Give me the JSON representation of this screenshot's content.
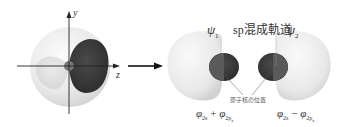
{
  "figure": {
    "left_panel": {
      "axis_y_label": "y",
      "axis_z_label": "z",
      "description": "2s orbital (sphere) overlapped with 2pz orbital lobe"
    },
    "arrow": "right-arrow",
    "right_panel": {
      "title": "sp混成軌道",
      "psi1_symbol": "ψ",
      "psi1_index": "1",
      "psi2_symbol": "ψ",
      "psi2_index": "2",
      "nucleus_label": "原子核の位置",
      "formula1": {
        "phi_a": "φ",
        "sub_a": "2s",
        "op": " + ",
        "phi_b": "φ",
        "sub_b": "2p",
        "sub_b_index": "z"
      },
      "formula2": {
        "phi_a": "φ",
        "sub_a": "2s",
        "op": " − ",
        "phi_b": "φ",
        "sub_b": "2p",
        "sub_b_index": "z"
      }
    },
    "colors": {
      "light_lobe": "#ececec",
      "dark_lobe": "#3a3a3a",
      "mid_lobe": "#6a6a6a",
      "axis": "#222222"
    }
  }
}
